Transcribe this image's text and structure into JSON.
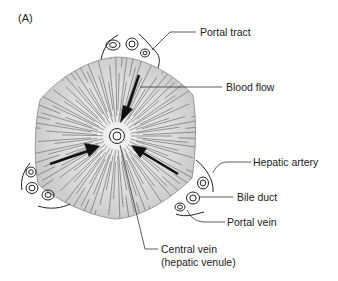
{
  "figure": {
    "panel_label": "(A)"
  },
  "labels": {
    "portal_tract": "Portal tract",
    "blood_flow": "Blood flow",
    "hepatic_artery": "Hepatic artery",
    "bile_duct": "Bile duct",
    "portal_vein": "Portal vein",
    "central_vein_line1": "Central vein",
    "central_vein_line2": "(hepatic venule)"
  },
  "colors": {
    "lobule_fill": "#cfcfcf",
    "lobule_center": "#f2f2f2",
    "stroke": "#222222",
    "sinusoid_lines": "#777777"
  }
}
